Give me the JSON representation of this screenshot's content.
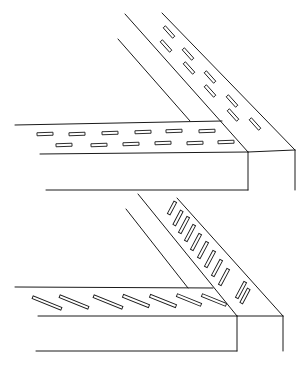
{
  "figures": [
    {
      "id": "top-joint",
      "description": "Mitered corner joint of two channel members with rectangular slots arranged in staggered rows",
      "lines": [
        [
          15,
          125,
          222,
          121
        ],
        [
          40,
          154,
          248,
          152
        ],
        [
          46,
          190,
          248,
          190
        ],
        [
          118,
          39,
          190,
          121
        ],
        [
          125,
          14,
          248,
          152
        ],
        [
          162,
          13,
          295,
          150
        ],
        [
          248,
          152,
          295,
          150
        ],
        [
          248,
          152,
          248,
          190
        ],
        [
          295,
          150,
          295,
          190
        ]
      ],
      "slots": [
        {
          "cx": 45,
          "cy": 134,
          "len": 16,
          "angle": -2
        },
        {
          "cx": 77,
          "cy": 134,
          "len": 16,
          "angle": -2
        },
        {
          "cx": 110,
          "cy": 133,
          "len": 16,
          "angle": -2
        },
        {
          "cx": 143,
          "cy": 132,
          "len": 16,
          "angle": -2
        },
        {
          "cx": 174,
          "cy": 131,
          "len": 16,
          "angle": -2
        },
        {
          "cx": 207,
          "cy": 131,
          "len": 16,
          "angle": -2
        },
        {
          "cx": 64,
          "cy": 145,
          "len": 16,
          "angle": -2
        },
        {
          "cx": 99,
          "cy": 145,
          "len": 16,
          "angle": -2
        },
        {
          "cx": 131,
          "cy": 144,
          "len": 16,
          "angle": -2
        },
        {
          "cx": 163,
          "cy": 143,
          "len": 16,
          "angle": -2
        },
        {
          "cx": 195,
          "cy": 143,
          "len": 16,
          "angle": -2
        },
        {
          "cx": 226,
          "cy": 142,
          "len": 16,
          "angle": -2
        },
        {
          "cx": 169,
          "cy": 32,
          "len": 14,
          "angle": 48
        },
        {
          "cx": 166,
          "cy": 46,
          "len": 14,
          "angle": 48
        },
        {
          "cx": 188,
          "cy": 54,
          "len": 14,
          "angle": 48
        },
        {
          "cx": 189,
          "cy": 68,
          "len": 14,
          "angle": 48
        },
        {
          "cx": 210,
          "cy": 77,
          "len": 14,
          "angle": 48
        },
        {
          "cx": 210,
          "cy": 91,
          "len": 14,
          "angle": 48
        },
        {
          "cx": 232,
          "cy": 101,
          "len": 14,
          "angle": 48
        },
        {
          "cx": 233,
          "cy": 115,
          "len": 14,
          "angle": 48
        },
        {
          "cx": 255,
          "cy": 124,
          "len": 14,
          "angle": 48
        }
      ]
    },
    {
      "id": "bottom-joint",
      "description": "Mitered corner joint with elongated angled slots on both members",
      "lines": [
        [
          126,
          209,
          188,
          288
        ],
        [
          138,
          194,
          237,
          316
        ],
        [
          177,
          198,
          283,
          316
        ],
        [
          15,
          287,
          213,
          288
        ],
        [
          38,
          316,
          237,
          316
        ],
        [
          36,
          351,
          237,
          351
        ],
        [
          237,
          316,
          283,
          316
        ],
        [
          237,
          316,
          237,
          351
        ],
        [
          283,
          316,
          283,
          351
        ]
      ],
      "slots": [
        {
          "cx": 47,
          "cy": 303,
          "len": 31,
          "angle": 22
        },
        {
          "cx": 74,
          "cy": 302,
          "len": 31,
          "angle": 22
        },
        {
          "cx": 108,
          "cy": 302,
          "len": 31,
          "angle": 22
        },
        {
          "cx": 136,
          "cy": 301,
          "len": 28,
          "angle": 22
        },
        {
          "cx": 163,
          "cy": 301,
          "len": 28,
          "angle": 22
        },
        {
          "cx": 189,
          "cy": 300,
          "len": 26,
          "angle": 22
        },
        {
          "cx": 214,
          "cy": 300,
          "len": 26,
          "angle": 22
        },
        {
          "cx": 172,
          "cy": 208,
          "len": 14,
          "angle": -62
        },
        {
          "cx": 178,
          "cy": 218,
          "len": 16,
          "angle": -62
        },
        {
          "cx": 184,
          "cy": 225,
          "len": 18,
          "angle": -62
        },
        {
          "cx": 190,
          "cy": 233,
          "len": 18,
          "angle": -62
        },
        {
          "cx": 196,
          "cy": 242,
          "len": 18,
          "angle": -62
        },
        {
          "cx": 203,
          "cy": 250,
          "len": 18,
          "angle": -62
        },
        {
          "cx": 210,
          "cy": 259,
          "len": 18,
          "angle": -62
        },
        {
          "cx": 217,
          "cy": 268,
          "len": 18,
          "angle": -62
        },
        {
          "cx": 224,
          "cy": 277,
          "len": 18,
          "angle": -62
        },
        {
          "cx": 241,
          "cy": 290,
          "len": 18,
          "angle": -62
        },
        {
          "cx": 245,
          "cy": 296,
          "len": 16,
          "angle": -62
        }
      ]
    }
  ]
}
